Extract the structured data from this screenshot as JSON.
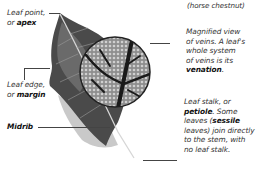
{
  "diagram": {
    "caption_top": "(horse chestnut)",
    "labels": {
      "apex": {
        "text": "Leaf point,",
        "or": "or ",
        "term": "apex"
      },
      "margin": {
        "text": "Leaf edge,",
        "or": "or ",
        "term": "margin"
      },
      "midrib": {
        "term": "Midrib"
      },
      "venation": {
        "line1": "Magnified view",
        "line2": "of veins. A leaf's",
        "line3": "whole system",
        "line4": "of veins is its",
        "term": "venation",
        "end": "."
      },
      "petiole": {
        "line1": "Leaf stalk, or",
        "term": "petiole",
        "line2_rest": ". Some",
        "line3": "leaves (",
        "term2": "sessile",
        "line4": "leaves) join directly",
        "line5": "to the stem, with",
        "line6": "no leaf stalk."
      }
    },
    "colors": {
      "leaf_dark": "#3a3a3a",
      "leaf_mid": "#6a6a6a",
      "leaf_light": "#c8c8c8",
      "vein": "#1a1a1a",
      "cells": "#9a9a9a",
      "leader": "#444444"
    }
  }
}
